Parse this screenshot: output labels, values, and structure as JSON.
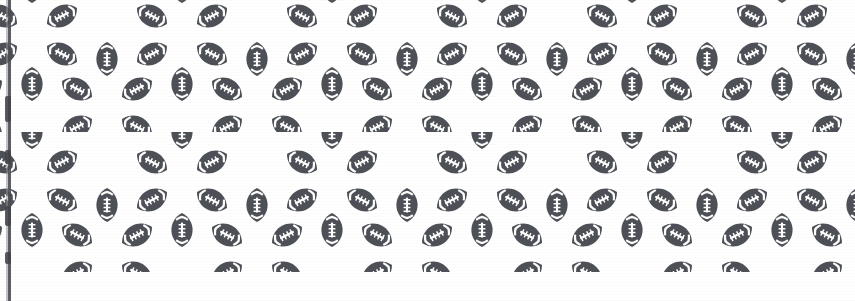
{
  "image": {
    "title": "Seamless Football Pattern Swatch",
    "description": "Repeating rosette pattern of American footballs printed in dark slate gray on a white background",
    "width_px": 855,
    "height_px": 301,
    "background_color": "#ffffff",
    "ink_color": "#4d5056",
    "ink_color_light": "#6d7076",
    "stitch_color": "#ffffff"
  },
  "pattern": {
    "motif_name": "american-football",
    "motif_count_per_cluster": 5,
    "cluster_arrangement": "rosette",
    "tile_width_px": 150,
    "tile_height_px": 146,
    "horizontal_repeat_px": 75,
    "vertical_repeat_px": 73,
    "stagger": "half-drop",
    "upright_tilt_deg": 0,
    "upper_left_tilt_deg": -35,
    "upper_right_tilt_deg": 35,
    "lower_left_tilt_deg": 35,
    "lower_right_tilt_deg": -35,
    "football_length_px": 34,
    "football_width_px": 21,
    "lace_count": 4,
    "stripe_count": 2
  },
  "edges": {
    "left_scan_line_color": "#4a4d52",
    "left_scan_line_x_px": 8,
    "left_scan_line_width_px": 3,
    "bottom_margin_height_px": 29,
    "bottom_margin_color": "#ffffff"
  },
  "edge_blots": [
    {
      "top_px": 96,
      "height_px": 26
    },
    {
      "top_px": 150,
      "height_px": 14
    },
    {
      "top_px": 206,
      "height_px": 20
    },
    {
      "top_px": 252,
      "height_px": 12
    }
  ]
}
